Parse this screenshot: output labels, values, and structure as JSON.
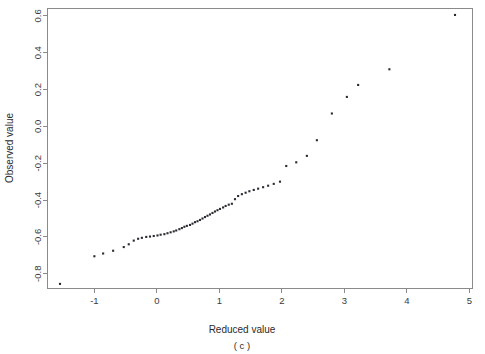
{
  "chart_data": {
    "type": "scatter",
    "title": "",
    "subtitle": "",
    "xlabel": "Reduced value",
    "ylabel": "Observed value",
    "panel_label": "( c )",
    "xlim": [
      -1.75,
      5.05
    ],
    "ylim": [
      -0.88,
      0.64
    ],
    "xticks": [
      -1,
      0,
      1,
      2,
      3,
      4,
      5
    ],
    "xtick_labels": [
      "-1",
      "0",
      "1",
      "2",
      "3",
      "4",
      "5"
    ],
    "yticks": [
      0.6,
      0.4,
      0.2,
      0.0,
      -0.2,
      -0.4,
      -0.6,
      -0.8
    ],
    "ytick_labels": [
      "0.6",
      "0.4",
      "0.2",
      "0.0",
      "-0.2",
      "-0.4",
      "-0.6",
      "-0.8"
    ],
    "grid": false,
    "legend": null,
    "marker": "filled-square",
    "marker_size": 2.1,
    "marker_color": "#2a2a33",
    "axis_color": "#8a8a8a",
    "background": "#ffffff",
    "x": [
      -1.55,
      -1.0,
      -0.86,
      -0.7,
      -0.53,
      -0.45,
      -0.37,
      -0.3,
      -0.24,
      -0.17,
      -0.11,
      -0.05,
      0.01,
      0.06,
      0.12,
      0.17,
      0.22,
      0.27,
      0.31,
      0.36,
      0.4,
      0.44,
      0.48,
      0.53,
      0.57,
      0.61,
      0.65,
      0.69,
      0.73,
      0.77,
      0.81,
      0.85,
      0.89,
      0.93,
      0.97,
      1.01,
      1.06,
      1.1,
      1.15,
      1.2,
      1.25,
      1.3,
      1.36,
      1.42,
      1.48,
      1.55,
      1.62,
      1.7,
      1.78,
      1.87,
      1.97,
      2.07,
      2.23,
      2.4,
      2.56,
      2.8,
      3.04,
      3.22,
      3.72,
      4.77
    ],
    "y": [
      -0.855,
      -0.705,
      -0.69,
      -0.675,
      -0.655,
      -0.64,
      -0.62,
      -0.61,
      -0.605,
      -0.6,
      -0.598,
      -0.595,
      -0.592,
      -0.588,
      -0.585,
      -0.58,
      -0.575,
      -0.57,
      -0.565,
      -0.558,
      -0.552,
      -0.545,
      -0.54,
      -0.535,
      -0.528,
      -0.52,
      -0.515,
      -0.508,
      -0.5,
      -0.492,
      -0.485,
      -0.478,
      -0.47,
      -0.462,
      -0.455,
      -0.448,
      -0.44,
      -0.432,
      -0.425,
      -0.42,
      -0.395,
      -0.378,
      -0.368,
      -0.36,
      -0.352,
      -0.345,
      -0.338,
      -0.33,
      -0.322,
      -0.312,
      -0.3,
      -0.215,
      -0.195,
      -0.16,
      -0.075,
      0.07,
      0.16,
      0.225,
      0.31,
      0.605
    ],
    "n_points": 60
  },
  "axes": {
    "x_title": "Reduced value",
    "y_title": "Observed value",
    "panel_caption": "( c )"
  }
}
